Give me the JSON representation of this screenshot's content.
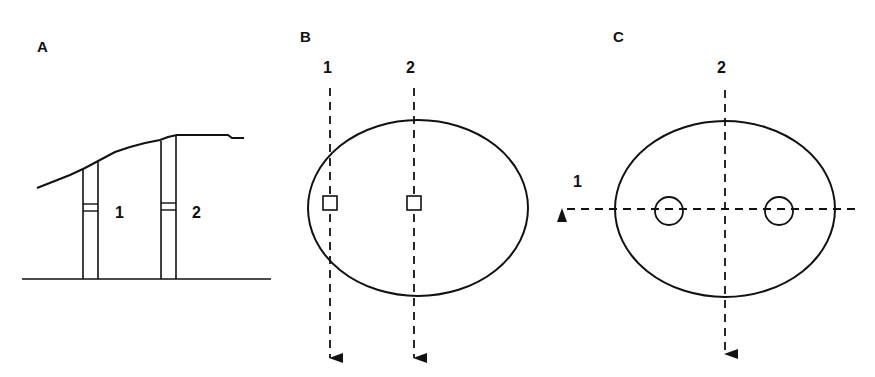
{
  "panels": {
    "A": {
      "label": "A",
      "wells": [
        {
          "label": "1"
        },
        {
          "label": "2"
        }
      ]
    },
    "B": {
      "label": "B",
      "paths": [
        {
          "label": "1"
        },
        {
          "label": "2"
        }
      ]
    },
    "C": {
      "label": "C",
      "paths": [
        {
          "label": "1"
        },
        {
          "label": "2"
        }
      ]
    }
  },
  "colors": {
    "stroke": "#111111",
    "background": "#ffffff"
  }
}
